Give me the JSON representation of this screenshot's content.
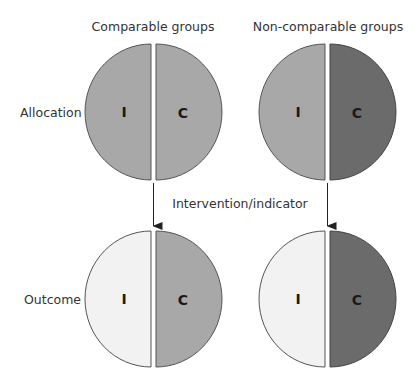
{
  "column_headers": {
    "left": "Comparable groups",
    "right": "Non-comparable groups"
  },
  "row_labels": {
    "top": "Allocation",
    "bottom": "Outcome"
  },
  "arrow_label": "Intervention/indicator",
  "half_labels": {
    "intervention": "I",
    "control": "C"
  },
  "colors": {
    "mid_gray": "#a8a8a8",
    "dark_gray": "#6b6b6b",
    "light_gray": "#f2f2f2",
    "outline": "#555555",
    "arrow": "#222222"
  },
  "circles": [
    {
      "name": "allocation-comparable",
      "i_fill": "#a8a8a8",
      "c_fill": "#a8a8a8"
    },
    {
      "name": "allocation-noncomparable",
      "i_fill": "#a8a8a8",
      "c_fill": "#6b6b6b"
    },
    {
      "name": "outcome-comparable",
      "i_fill": "#f2f2f2",
      "c_fill": "#a8a8a8"
    },
    {
      "name": "outcome-noncomparable",
      "i_fill": "#f2f2f2",
      "c_fill": "#6b6b6b"
    }
  ]
}
